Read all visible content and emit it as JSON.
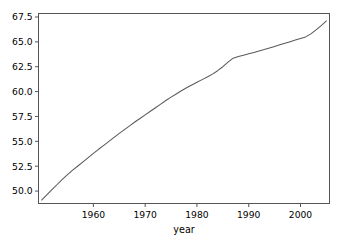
{
  "chart_data": {
    "type": "line",
    "title": "",
    "xlabel": "year",
    "ylabel": "",
    "grid": false,
    "legend": false,
    "line_color": "#5a5a5a",
    "axes_color": "#555555",
    "background_color": "#ffffff",
    "xlim": [
      1949.4,
      2005.6
    ],
    "ylim": [
      48.75,
      67.85
    ],
    "xticks": [
      1960,
      1970,
      1980,
      1990,
      2000
    ],
    "xtick_labels": [
      "1960",
      "1970",
      "1980",
      "1990",
      "2000"
    ],
    "yticks": [
      50.0,
      52.5,
      55.0,
      57.5,
      60.0,
      62.5,
      65.0,
      67.5
    ],
    "ytick_labels": [
      "50.0",
      "52.5",
      "55.0",
      "57.5",
      "60.0",
      "62.5",
      "65.0",
      "67.5"
    ],
    "series": [
      {
        "name": "life expectancy",
        "x": [
          1950,
          1951,
          1952,
          1953,
          1954,
          1955,
          1956,
          1957,
          1958,
          1959,
          1960,
          1961,
          1962,
          1963,
          1964,
          1965,
          1966,
          1967,
          1968,
          1969,
          1970,
          1971,
          1972,
          1973,
          1974,
          1975,
          1976,
          1977,
          1978,
          1979,
          1980,
          1981,
          1982,
          1983,
          1984,
          1985,
          1986,
          1987,
          1988,
          1989,
          1990,
          1991,
          1992,
          1993,
          1994,
          1995,
          1996,
          1997,
          1998,
          1999,
          2000,
          2001,
          2002,
          2003,
          2004,
          2005
        ],
        "y": [
          49.1,
          49.62,
          50.14,
          50.66,
          51.18,
          51.66,
          52.1,
          52.52,
          52.94,
          53.36,
          53.78,
          54.2,
          54.6,
          55.0,
          55.4,
          55.8,
          56.18,
          56.56,
          56.94,
          57.3,
          57.66,
          58.02,
          58.38,
          58.74,
          59.1,
          59.44,
          59.76,
          60.08,
          60.38,
          60.66,
          60.94,
          61.2,
          61.46,
          61.76,
          62.1,
          62.5,
          62.96,
          63.36,
          63.52,
          63.66,
          63.8,
          63.94,
          64.08,
          64.22,
          64.38,
          64.54,
          64.7,
          64.86,
          65.02,
          65.18,
          65.34,
          65.5,
          65.8,
          66.2,
          66.64,
          67.1
        ]
      }
    ]
  },
  "axis_label_text": {
    "x": "year"
  }
}
